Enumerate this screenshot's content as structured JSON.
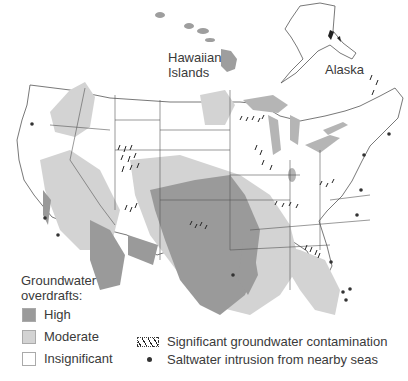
{
  "map": {
    "title": "Groundwater overdrafts and contamination in the United States",
    "labels": {
      "hawaii": [
        "Hawaiian",
        "Islands"
      ],
      "alaska": "Alaska"
    }
  },
  "legend": {
    "title_lines": [
      "Groundwater",
      "overdrafts:"
    ],
    "overdraft_levels": [
      {
        "label": "High",
        "color": "#9a9a9a"
      },
      {
        "label": "Moderate",
        "color": "#d3d3d3"
      },
      {
        "label": "Insignificant",
        "color": "#ffffff"
      }
    ],
    "symbols": [
      {
        "icon": "hatch-pattern-icon",
        "label": "Significant groundwater contamination"
      },
      {
        "icon": "dot-icon",
        "label": "Saltwater intrusion from nearby seas"
      }
    ]
  },
  "colors": {
    "high": "#9a9a9a",
    "moderate": "#d3d3d3",
    "insignificant": "#ffffff",
    "border": "#555555",
    "lakes": "#b5b5b5"
  }
}
